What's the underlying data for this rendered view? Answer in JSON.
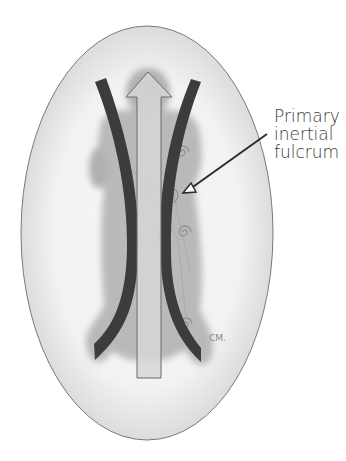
{
  "figure": {
    "type": "anatomical diagram",
    "annotation": {
      "line1": "Primary",
      "line2": "inertial",
      "line3": "fulcrum"
    },
    "signature": "CM",
    "colors": {
      "oval_fill": "#e6e6e6",
      "oval_stroke": "#7a7a7a",
      "figure": "#a8a8a8",
      "arcs": "#3c3c3c",
      "arrow_fill": "#d8d8d8",
      "arrow_stroke": "#6a6a6a"
    }
  }
}
